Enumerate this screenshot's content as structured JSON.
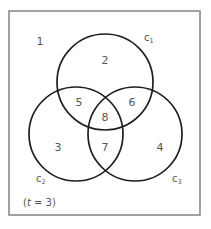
{
  "diagram": {
    "type": "venn",
    "sets": [
      {
        "id": "c1",
        "letter": "c",
        "subscript": "1"
      },
      {
        "id": "c2",
        "letter": "c",
        "subscript": "2"
      },
      {
        "id": "c3",
        "letter": "c",
        "subscript": "3"
      }
    ],
    "regions": [
      {
        "number": "1",
        "membership": "outside all"
      },
      {
        "number": "2",
        "membership": "c1 only"
      },
      {
        "number": "3",
        "membership": "c2 only"
      },
      {
        "number": "4",
        "membership": "c3 only"
      },
      {
        "number": "5",
        "membership": "c1 and c2"
      },
      {
        "number": "6",
        "membership": "c1 and c3"
      },
      {
        "number": "7",
        "membership": "c2 and c3"
      },
      {
        "number": "8",
        "membership": "c1, c2 and c3"
      }
    ],
    "note": {
      "open": "(",
      "variable": "t",
      "rest": " = 3)"
    }
  }
}
